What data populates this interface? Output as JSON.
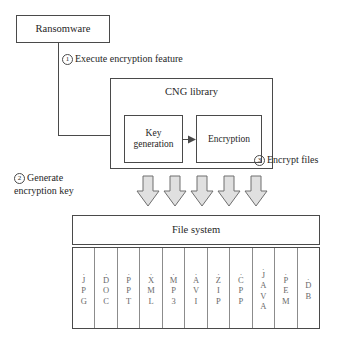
{
  "diagram": {
    "title_text": "Ransomware CNG library encryption flow",
    "nodes": {
      "ransomware": "Ransomware",
      "cng_library": "CNG library",
      "key_generation": "Key\ngeneration",
      "key_generation_line1": "Key",
      "key_generation_line2": "generation",
      "encryption": "Encryption",
      "file_system": "File system"
    },
    "steps": [
      {
        "number": "1",
        "label": "Execute encryption feature"
      },
      {
        "number": "2",
        "label_line1": "Generate",
        "label_line2": "encryption key"
      },
      {
        "number": "3",
        "label": "Encrypt files"
      }
    ],
    "arrows": {
      "count": 5,
      "direction": "down",
      "fill": "#e0e0e0",
      "stroke": "#6e6e6e",
      "icon_name": "down-block-arrow-icon"
    },
    "file_extensions": [
      {
        "dot": ".",
        "chars": [
          "J",
          "P",
          "G"
        ]
      },
      {
        "dot": ".",
        "chars": [
          "D",
          "O",
          "C"
        ]
      },
      {
        "dot": ".",
        "chars": [
          "P",
          "P",
          "T"
        ]
      },
      {
        "dot": ".",
        "chars": [
          "X",
          "M",
          "L"
        ]
      },
      {
        "dot": ".",
        "chars": [
          "M",
          "P",
          "3"
        ]
      },
      {
        "dot": ".",
        "chars": [
          "A",
          "V",
          "I"
        ]
      },
      {
        "dot": ".",
        "chars": [
          "Z",
          "I",
          "P"
        ]
      },
      {
        "dot": ".",
        "chars": [
          "C",
          "P",
          "P"
        ]
      },
      {
        "dot": ".",
        "chars": [
          "J",
          "A",
          "V",
          "A"
        ]
      },
      {
        "dot": ".",
        "chars": [
          "P",
          "E",
          "M"
        ]
      },
      {
        "dot": ".",
        "chars": [
          "D",
          "B"
        ]
      }
    ],
    "colors": {
      "line": "#4a4a4a",
      "background": "#ffffff",
      "text": "#262626",
      "muted_text": "#6b6b6b",
      "arrow_fill": "#e0e0e0"
    }
  }
}
